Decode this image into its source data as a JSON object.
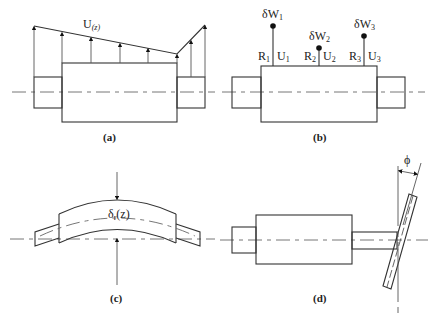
{
  "figure": {
    "panels": [
      {
        "id": "a",
        "caption": "(a)",
        "label_main": "U",
        "label_sub": "(z)"
      },
      {
        "id": "b",
        "caption": "(b)",
        "weights": [
          {
            "label": "δW",
            "sub": "1",
            "r_label": "R",
            "r_sub": "1",
            "u_label": "U",
            "u_sub": "1"
          },
          {
            "label": "δW",
            "sub": "2",
            "r_label": "R",
            "r_sub": "2",
            "u_label": "U",
            "u_sub": "2"
          },
          {
            "label": "δW",
            "sub": "3",
            "r_label": "R",
            "r_sub": "3",
            "u_label": "U",
            "u_sub": "3"
          }
        ]
      },
      {
        "id": "c",
        "caption": "(c)",
        "label_main": "δ",
        "label_sub": "r",
        "label_tail": "(z)"
      },
      {
        "id": "d",
        "caption": "(d)",
        "angle_label": "ϕ"
      }
    ]
  }
}
